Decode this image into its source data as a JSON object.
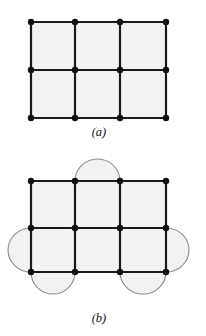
{
  "page": {
    "background_color": "#ffffff",
    "width": 206,
    "height": 336
  },
  "style": {
    "edge_color": "#1a1a1a",
    "edge_width": 2.2,
    "node_color": "#111111",
    "node_radius": 3.2,
    "cell_fill": "#f2f2f2",
    "arc_stroke_color": "#8c8c8c",
    "arc_stroke_width": 1.1,
    "arc_fill": "#f2f2f2",
    "caption_color": "#111111"
  },
  "figures": [
    {
      "id": "figure-a",
      "caption": "(a)",
      "caption_x": 99,
      "caption_y": 136,
      "description": "3 by 2 rectangular grid graph with 12 vertices",
      "grid": {
        "columns_x": [
          31,
          75,
          120,
          166
        ],
        "rows_y": [
          22,
          70,
          118
        ],
        "cols": 3,
        "rows": 2,
        "vertex_count": 12,
        "edge_count": 17
      },
      "arcs": []
    },
    {
      "id": "figure-b",
      "caption": "(b)",
      "caption_x": 99,
      "caption_y": 322,
      "description": "Same 3 by 2 grid graph with five semicircular lobes attached to boundary cells",
      "grid": {
        "columns_x": [
          31,
          75,
          120,
          166
        ],
        "rows_y": [
          181,
          228,
          272
        ],
        "cols": 3,
        "rows": 2,
        "vertex_count": 12,
        "edge_count": 17
      },
      "arcs": [
        {
          "name": "top-lobe-middle",
          "side": "top",
          "x1": 75,
          "y1": 181,
          "x2": 120,
          "y2": 181,
          "bulge": 22
        },
        {
          "name": "left-lobe-middle",
          "side": "left",
          "x1": 31,
          "y1": 228,
          "x2": 31,
          "y2": 272,
          "bulge": 23
        },
        {
          "name": "right-lobe-middle",
          "side": "right",
          "x1": 166,
          "y1": 228,
          "x2": 166,
          "y2": 272,
          "bulge": 23
        },
        {
          "name": "bottom-lobe-left",
          "side": "bottom",
          "x1": 31,
          "y1": 272,
          "x2": 75,
          "y2": 272,
          "bulge": 22
        },
        {
          "name": "bottom-lobe-right",
          "side": "bottom",
          "x1": 120,
          "y1": 272,
          "x2": 166,
          "y2": 272,
          "bulge": 22
        }
      ]
    }
  ]
}
